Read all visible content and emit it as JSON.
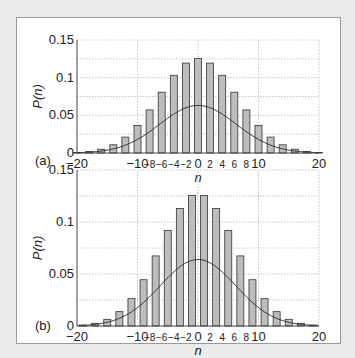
{
  "chart_data": [
    {
      "panel_label": "(a)",
      "type": "bar",
      "xlabel": "n",
      "ylabel": "P(n)",
      "xlim": [
        -20,
        20
      ],
      "ylim": [
        0,
        0.15
      ],
      "grid": true,
      "x_ticks": [
        -20,
        -10,
        -8,
        -6,
        -4,
        -2,
        0,
        2,
        4,
        6,
        8,
        10,
        20
      ],
      "y_ticks": [
        0,
        0.05,
        0.1,
        0.15
      ],
      "y_tick_labels": [
        "0",
        "0.05",
        "0.1",
        "0.15"
      ],
      "x": [
        -20,
        -18,
        -16,
        -14,
        -12,
        -10,
        -8,
        -6,
        -4,
        -2,
        0,
        2,
        4,
        6,
        8,
        10,
        12,
        14,
        16,
        18,
        20
      ],
      "values": [
        0.0007,
        0.002,
        0.005,
        0.0109,
        0.0211,
        0.0366,
        0.0572,
        0.0807,
        0.1031,
        0.1194,
        0.1254,
        0.1194,
        0.1031,
        0.0807,
        0.0572,
        0.0366,
        0.0211,
        0.0109,
        0.005,
        0.002,
        0.0007
      ],
      "curve": {
        "type": "line",
        "name": "Gaussian",
        "mean": 0,
        "sigma": 6.32,
        "peak": 0.0631
      }
    },
    {
      "panel_label": "(b)",
      "type": "bar",
      "xlabel": "n",
      "ylabel": "P(n)",
      "xlim": [
        -20,
        20
      ],
      "ylim": [
        0,
        0.15
      ],
      "grid": true,
      "x_ticks": [
        -20,
        -10,
        -8,
        -6,
        -4,
        -2,
        0,
        2,
        4,
        6,
        8,
        10,
        20
      ],
      "y_ticks": [
        0,
        0.05,
        0.1,
        0.15
      ],
      "y_tick_labels": [
        "0",
        "0.05",
        "0.1",
        "0.15"
      ],
      "x": [
        -19,
        -17,
        -15,
        -13,
        -11,
        -9,
        -7,
        -5,
        -3,
        -1,
        1,
        3,
        5,
        7,
        9,
        11,
        13,
        15,
        17,
        19
      ],
      "values": [
        0.0009,
        0.0026,
        0.0064,
        0.0138,
        0.0263,
        0.0445,
        0.0674,
        0.0919,
        0.1129,
        0.1254,
        0.1254,
        0.1129,
        0.0919,
        0.0674,
        0.0445,
        0.0263,
        0.0138,
        0.0064,
        0.0026,
        0.0009
      ],
      "curve": {
        "type": "line",
        "name": "Gaussian",
        "mean": 0,
        "sigma": 6.245,
        "peak": 0.0639
      }
    }
  ],
  "colors": {
    "bar_fill": "#bdbdbd",
    "bar_stroke": "#333333",
    "grid": "#b5b5b5",
    "curve": "#333333",
    "background": "#ebebeb",
    "panel": "#ffffff"
  }
}
